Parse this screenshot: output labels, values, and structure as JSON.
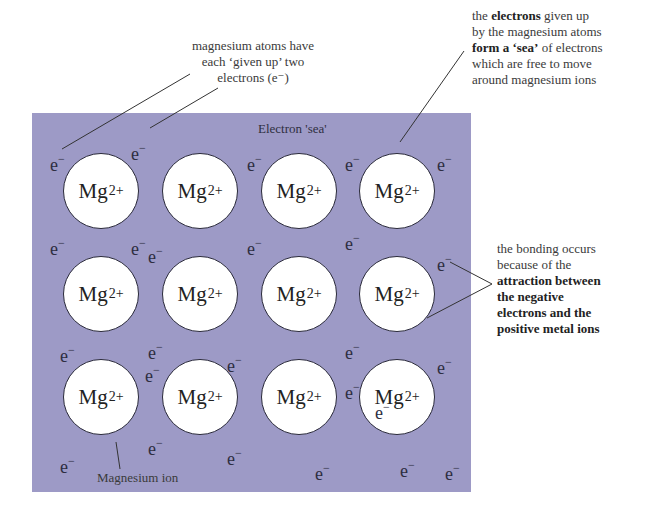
{
  "diagram": {
    "colors": {
      "sea": "#9d9ac6",
      "ion_fill": "#ffffff",
      "ion_outline": "#2a2a3a",
      "text": "#2a2a2a"
    },
    "sea_label": "Electron 'sea'",
    "ion": {
      "symbol": "Mg",
      "charge": "2+"
    },
    "electron": {
      "symbol": "e",
      "charge": "−"
    },
    "ion_grid": {
      "rows": 3,
      "cols": 4
    },
    "ion_positions": [
      [
        63,
        153
      ],
      [
        162,
        153
      ],
      [
        261,
        153
      ],
      [
        359,
        153
      ],
      [
        63,
        256
      ],
      [
        162,
        256
      ],
      [
        261,
        256
      ],
      [
        359,
        256
      ],
      [
        63,
        359
      ],
      [
        162,
        359
      ],
      [
        261,
        359
      ],
      [
        359,
        359
      ]
    ],
    "electron_positions": [
      [
        50,
        153
      ],
      [
        131,
        142
      ],
      [
        247,
        153
      ],
      [
        345,
        153
      ],
      [
        437,
        153
      ],
      [
        50,
        237
      ],
      [
        131,
        237
      ],
      [
        148,
        245
      ],
      [
        247,
        237
      ],
      [
        345,
        232
      ],
      [
        437,
        253
      ],
      [
        60,
        344
      ],
      [
        148,
        341
      ],
      [
        145,
        364
      ],
      [
        227,
        354
      ],
      [
        345,
        341
      ],
      [
        437,
        356
      ],
      [
        60,
        455
      ],
      [
        148,
        437
      ],
      [
        227,
        447
      ],
      [
        315,
        462
      ],
      [
        400,
        459
      ],
      [
        445,
        462
      ],
      [
        345,
        381
      ],
      [
        375,
        401
      ]
    ],
    "annotations": {
      "top_left": {
        "lines": [
          "magnesium atoms have",
          "each ‘given up’ two",
          "electrons (e⁻)"
        ]
      },
      "top_right": {
        "lines": [
          [
            {
              "t": "the ",
              "b": false
            },
            {
              "t": "electrons",
              "b": true
            },
            {
              "t": " given up",
              "b": false
            }
          ],
          [
            {
              "t": "by the magnesium atoms",
              "b": false
            }
          ],
          [
            {
              "t": "form a ‘sea’",
              "b": true
            },
            {
              "t": " of electrons",
              "b": false
            }
          ],
          [
            {
              "t": "which are free to move",
              "b": false
            }
          ],
          [
            {
              "t": "around magnesium ions",
              "b": false
            }
          ]
        ]
      },
      "right": {
        "lines": [
          [
            {
              "t": "the bonding occurs",
              "b": false
            }
          ],
          [
            {
              "t": "because of the",
              "b": false
            }
          ],
          [
            {
              "t": "attraction between",
              "b": true
            }
          ],
          [
            {
              "t": "the negative",
              "b": true
            }
          ],
          [
            {
              "t": "electrons and the",
              "b": true
            }
          ],
          [
            {
              "t": "positive metal ions",
              "b": true
            }
          ]
        ]
      },
      "bottom": {
        "label": "Magnesium ion"
      }
    }
  }
}
